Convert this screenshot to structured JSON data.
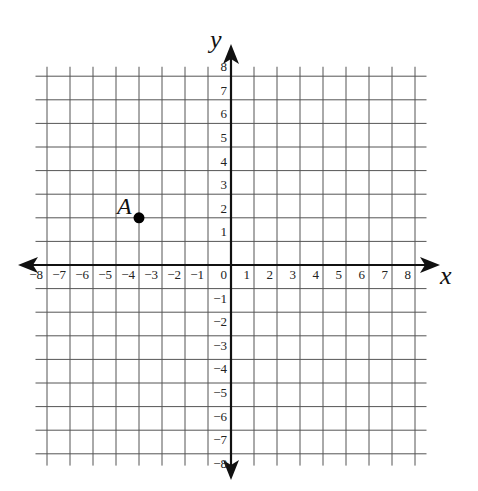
{
  "diagram": {
    "type": "coordinate-plane",
    "x_axis_label": "x",
    "y_axis_label": "y",
    "x_range": [
      -8,
      8
    ],
    "y_range": [
      -8,
      8
    ],
    "grid_step": 1,
    "x_ticks": [
      "−8",
      "−7",
      "−6",
      "−5",
      "−4",
      "−3",
      "−2",
      "−1",
      "0",
      "1",
      "2",
      "3",
      "4",
      "5",
      "6",
      "7",
      "8"
    ],
    "y_ticks_positive": [
      "1",
      "2",
      "3",
      "4",
      "5",
      "6",
      "7",
      "8"
    ],
    "y_ticks_negative": [
      "−1",
      "−2",
      "−3",
      "−4",
      "−5",
      "−6",
      "−7",
      "−8"
    ],
    "points": [
      {
        "label": "A",
        "x": -4,
        "y": 2
      }
    ],
    "colors": {
      "grid": "#555555",
      "axis": "#111111",
      "point": "#000000"
    }
  }
}
